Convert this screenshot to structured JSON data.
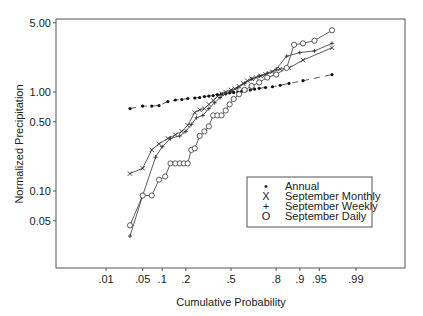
{
  "chart_data": {
    "type": "line",
    "title": "",
    "xlabel": "Cumulative Probability",
    "ylabel": "Normalized Precipitation",
    "x_scale": "normal-probability",
    "y_scale": "log",
    "xlim": [
      0.005,
      0.998
    ],
    "ylim": [
      0.02,
      5.0
    ],
    "x_ticks": [
      ".01",
      ".05",
      ".1",
      ".2",
      ".5",
      ".8",
      ".9",
      ".95",
      ".99"
    ],
    "x_tick_values": [
      0.01,
      0.05,
      0.1,
      0.2,
      0.5,
      0.8,
      0.9,
      0.95,
      0.99
    ],
    "y_ticks": [
      "5.00",
      "1.00",
      "0.50",
      "0.10",
      "0.05"
    ],
    "y_tick_values": [
      5.0,
      1.0,
      0.5,
      0.1,
      0.05
    ],
    "grid": false,
    "legend_position": "lower right inside",
    "series": [
      {
        "name": "Annual",
        "marker": "dot",
        "points": [
          [
            0.03,
            0.68
          ],
          [
            0.05,
            0.72
          ],
          [
            0.07,
            0.72
          ],
          [
            0.09,
            0.73
          ],
          [
            0.12,
            0.8
          ],
          [
            0.15,
            0.83
          ],
          [
            0.18,
            0.84
          ],
          [
            0.21,
            0.86
          ],
          [
            0.25,
            0.87
          ],
          [
            0.28,
            0.88
          ],
          [
            0.31,
            0.9
          ],
          [
            0.34,
            0.91
          ],
          [
            0.37,
            0.92
          ],
          [
            0.4,
            0.94
          ],
          [
            0.43,
            0.95
          ],
          [
            0.46,
            0.96
          ],
          [
            0.49,
            0.98
          ],
          [
            0.52,
            0.99
          ],
          [
            0.55,
            1.0
          ],
          [
            0.58,
            1.02
          ],
          [
            0.61,
            1.03
          ],
          [
            0.64,
            1.05
          ],
          [
            0.67,
            1.07
          ],
          [
            0.7,
            1.09
          ],
          [
            0.74,
            1.11
          ],
          [
            0.78,
            1.13
          ],
          [
            0.82,
            1.17
          ],
          [
            0.86,
            1.22
          ],
          [
            0.91,
            1.3
          ],
          [
            0.97,
            1.5
          ]
        ]
      },
      {
        "name": "September Monthly",
        "marker": "x",
        "points": [
          [
            0.03,
            0.15
          ],
          [
            0.05,
            0.17
          ],
          [
            0.07,
            0.26
          ],
          [
            0.09,
            0.3
          ],
          [
            0.12,
            0.34
          ],
          [
            0.15,
            0.37
          ],
          [
            0.18,
            0.4
          ],
          [
            0.21,
            0.46
          ],
          [
            0.25,
            0.62
          ],
          [
            0.28,
            0.66
          ],
          [
            0.31,
            0.68
          ],
          [
            0.34,
            0.75
          ],
          [
            0.37,
            0.82
          ],
          [
            0.4,
            0.9
          ],
          [
            0.43,
            0.96
          ],
          [
            0.46,
            1.0
          ],
          [
            0.5,
            1.05
          ],
          [
            0.53,
            1.08
          ],
          [
            0.56,
            1.14
          ],
          [
            0.59,
            1.22
          ],
          [
            0.62,
            1.3
          ],
          [
            0.65,
            1.36
          ],
          [
            0.68,
            1.4
          ],
          [
            0.71,
            1.45
          ],
          [
            0.74,
            1.5
          ],
          [
            0.78,
            1.6
          ],
          [
            0.82,
            1.7
          ],
          [
            0.86,
            1.75
          ],
          [
            0.91,
            2.1
          ],
          [
            0.97,
            2.8
          ]
        ]
      },
      {
        "name": "September Weekly",
        "marker": "plus",
        "points": [
          [
            0.03,
            0.035
          ],
          [
            0.05,
            0.09
          ],
          [
            0.08,
            0.22
          ],
          [
            0.1,
            0.28
          ],
          [
            0.13,
            0.34
          ],
          [
            0.17,
            0.36
          ],
          [
            0.2,
            0.4
          ],
          [
            0.23,
            0.47
          ],
          [
            0.26,
            0.55
          ],
          [
            0.3,
            0.58
          ],
          [
            0.34,
            0.68
          ],
          [
            0.38,
            0.78
          ],
          [
            0.42,
            0.88
          ],
          [
            0.46,
            0.96
          ],
          [
            0.5,
            1.02
          ],
          [
            0.55,
            1.1
          ],
          [
            0.6,
            1.22
          ],
          [
            0.65,
            1.35
          ],
          [
            0.7,
            1.45
          ],
          [
            0.75,
            1.55
          ],
          [
            0.8,
            1.7
          ],
          [
            0.85,
            2.3
          ],
          [
            0.9,
            2.5
          ],
          [
            0.94,
            2.6
          ],
          [
            0.97,
            3.1
          ]
        ]
      },
      {
        "name": "September Daily",
        "marker": "circle",
        "points": [
          [
            0.03,
            0.045
          ],
          [
            0.05,
            0.09
          ],
          [
            0.07,
            0.09
          ],
          [
            0.09,
            0.13
          ],
          [
            0.11,
            0.14
          ],
          [
            0.13,
            0.19
          ],
          [
            0.15,
            0.19
          ],
          [
            0.17,
            0.19
          ],
          [
            0.19,
            0.19
          ],
          [
            0.21,
            0.19
          ],
          [
            0.23,
            0.26
          ],
          [
            0.25,
            0.27
          ],
          [
            0.28,
            0.36
          ],
          [
            0.31,
            0.4
          ],
          [
            0.34,
            0.45
          ],
          [
            0.37,
            0.58
          ],
          [
            0.4,
            0.58
          ],
          [
            0.43,
            0.58
          ],
          [
            0.46,
            0.65
          ],
          [
            0.49,
            0.75
          ],
          [
            0.52,
            0.85
          ],
          [
            0.56,
            0.95
          ],
          [
            0.6,
            1.05
          ],
          [
            0.65,
            1.15
          ],
          [
            0.7,
            1.25
          ],
          [
            0.75,
            1.4
          ],
          [
            0.8,
            1.5
          ],
          [
            0.85,
            1.75
          ],
          [
            0.88,
            3.0
          ],
          [
            0.91,
            3.1
          ],
          [
            0.94,
            3.3
          ],
          [
            0.97,
            4.2
          ]
        ]
      }
    ]
  },
  "legend": {
    "items": [
      {
        "symbol": "•",
        "label": "Annual"
      },
      {
        "symbol": "X",
        "label": "September Monthly"
      },
      {
        "symbol": "+",
        "label": "September Weekly"
      },
      {
        "symbol": "O",
        "label": "September Daily"
      }
    ]
  },
  "colors": {
    "line": "#333333",
    "frame": "#555555",
    "text": "#222222",
    "background": "#ffffff"
  }
}
